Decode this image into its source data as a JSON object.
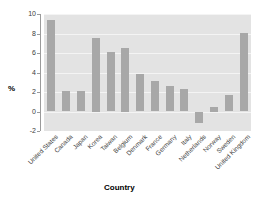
{
  "chart_data": {
    "type": "bar",
    "title": "",
    "subtitle": "",
    "xlabel": "Country",
    "ylabel": "%",
    "categories": [
      "United States",
      "Canada",
      "Japan",
      "Korea",
      "Taiwan",
      "Belgium",
      "Denmark",
      "France",
      "Germany",
      "Italy",
      "Netherlands",
      "Norway",
      "Sweden",
      "United Kingdom"
    ],
    "values": [
      9.4,
      2.1,
      2.1,
      7.5,
      6.1,
      6.5,
      3.8,
      3.1,
      2.6,
      2.3,
      -1.2,
      0.5,
      1.7,
      8.1
    ],
    "ylim": [
      -2,
      10
    ],
    "yticks": [
      10,
      8,
      6,
      4,
      2,
      0,
      -2
    ],
    "ytick_labels": [
      "10",
      "8",
      "6",
      "4",
      "2",
      "0",
      "-2"
    ],
    "grid": true,
    "grid_axis": "y",
    "legend": null,
    "legend_position": "none",
    "bar_color": "#a8a8a8",
    "plot_background": "#e3e3e3",
    "grid_color": "#f4f4f4",
    "figure_background": "#ffffff",
    "axis_color": "#9a9a9a",
    "tick_label_color": "#3c3c3c",
    "xtick_rotation": -45
  }
}
